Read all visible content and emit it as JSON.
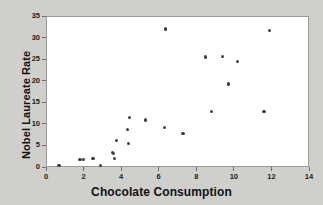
{
  "chart_data": {
    "type": "scatter",
    "title": "",
    "xlabel": "Chocolate Consumption",
    "ylabel": "Nobel Laureate Rate",
    "xlim": [
      0,
      14
    ],
    "ylim": [
      0,
      35
    ],
    "xticks": [
      0,
      2,
      4,
      6,
      8,
      10,
      12,
      14
    ],
    "yticks": [
      0,
      5,
      10,
      15,
      20,
      25,
      30,
      35
    ],
    "grid": false,
    "legend": null,
    "marker_color": "#3f3f4a",
    "plot_background": "#ffffff",
    "figure_background": "#cfcfcc",
    "points": [
      {
        "x": 0.7,
        "y": 0.3
      },
      {
        "x": 1.8,
        "y": 1.7
      },
      {
        "x": 2.0,
        "y": 1.8
      },
      {
        "x": 2.5,
        "y": 2.0
      },
      {
        "x": 2.9,
        "y": 0.3
      },
      {
        "x": 3.55,
        "y": 3.4
      },
      {
        "x": 3.6,
        "y": 3.1
      },
      {
        "x": 3.65,
        "y": 1.9
      },
      {
        "x": 3.75,
        "y": 6.2
      },
      {
        "x": 4.35,
        "y": 8.7
      },
      {
        "x": 4.4,
        "y": 5.5
      },
      {
        "x": 4.45,
        "y": 11.5
      },
      {
        "x": 5.3,
        "y": 10.9
      },
      {
        "x": 6.3,
        "y": 9.2
      },
      {
        "x": 6.35,
        "y": 32.0
      },
      {
        "x": 7.3,
        "y": 7.8
      },
      {
        "x": 8.5,
        "y": 25.5
      },
      {
        "x": 8.8,
        "y": 12.9
      },
      {
        "x": 9.4,
        "y": 25.6
      },
      {
        "x": 9.7,
        "y": 19.2
      },
      {
        "x": 10.2,
        "y": 24.5
      },
      {
        "x": 11.6,
        "y": 12.9
      },
      {
        "x": 11.9,
        "y": 31.6
      }
    ]
  }
}
